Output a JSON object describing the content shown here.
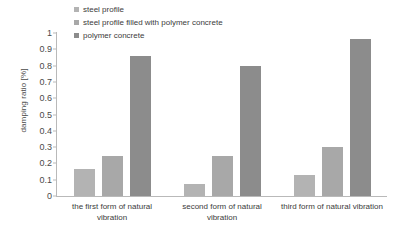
{
  "chart_data": {
    "type": "bar",
    "title": "",
    "xlabel": "",
    "ylabel": "damping ratio [%]",
    "ylim": [
      0,
      1
    ],
    "yticks": [
      "1",
      "0.9",
      "0.8",
      "0.7",
      "0.6",
      "0.5",
      "0.4",
      "0.3",
      "0.2",
      "0.1",
      "0"
    ],
    "ytick_values": [
      1,
      0.9,
      0.8,
      0.7,
      0.6,
      0.5,
      0.4,
      0.3,
      0.2,
      0.1,
      0
    ],
    "grid": false,
    "legend_position": "top-left-inside",
    "categories": [
      "the first form of natural vibration",
      "second form of natural vibration",
      "third form of natural vibration"
    ],
    "series": [
      {
        "name": "steel profile",
        "color": "#b3b3b3",
        "values": [
          0.165,
          0.074,
          0.13
        ]
      },
      {
        "name": "steel profile filled with polymer concrete",
        "color": "#a8a8a8",
        "values": [
          0.248,
          0.245,
          0.302
        ]
      },
      {
        "name": "polymer concrete",
        "color": "#8c8c8c",
        "values": [
          0.858,
          0.795,
          0.962
        ]
      }
    ]
  },
  "axis": {
    "line_color": "#b9b9b9"
  }
}
